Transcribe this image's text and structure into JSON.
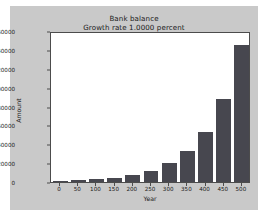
{
  "chart_data": {
    "type": "bar",
    "title": "Bank balance",
    "subtitle": "Growth rate 1.0000 percent",
    "xlabel": "Year",
    "ylabel": "Amount",
    "categories": [
      "0",
      "50",
      "100",
      "150",
      "200",
      "250",
      "300",
      "350",
      "400",
      "450",
      "500"
    ],
    "x": [
      0,
      50,
      100,
      150,
      200,
      250,
      300,
      350,
      400,
      450,
      500
    ],
    "values": [
      1000,
      1645,
      2705,
      4448,
      7316,
      12033,
      19789,
      32541,
      53514,
      88004,
      144773
    ],
    "xlim": [
      -25,
      525
    ],
    "ylim": [
      0,
      160000
    ],
    "ytick_labels": [
      "0",
      "20000",
      "40000",
      "60000",
      "80000",
      "100000",
      "120000",
      "140000",
      "160000"
    ],
    "ytick_values": [
      0,
      20000,
      40000,
      60000,
      80000,
      100000,
      120000,
      140000,
      160000
    ],
    "grid": false,
    "legend": false,
    "bar_color": "#47474f",
    "plot_background": "#ffffff",
    "figure_background": "#c9c9c9",
    "axis_color": "#4c4c4c"
  }
}
